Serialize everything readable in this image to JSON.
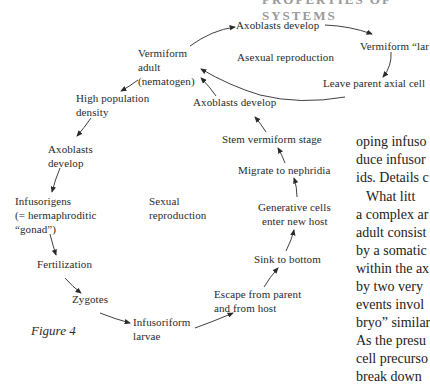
{
  "header_cut": "PROPERTIES OF SYSTEMS",
  "diagram": {
    "nodes": {
      "axoblasts_top": "Axoblasts develop",
      "vermiform_larva": "Vermiform “lar",
      "asexual": "Asexual reproduction",
      "leave_parent": "Leave parent axial cell",
      "vermiform_adult": [
        "Vermiform",
        "adult",
        "(nematogen)"
      ],
      "high_pop": [
        "High population",
        "density"
      ],
      "axoblasts_right": "Axoblasts develop",
      "stem_vermiform": "Stem vermiform stage",
      "migrate": "Migrate to nephridia",
      "generative": [
        "Generative cells",
        "enter new host"
      ],
      "sink": "Sink to bottom",
      "escape": [
        "Escape from parent",
        "and from host"
      ],
      "axoblasts_left": [
        "Axoblasts",
        "develop"
      ],
      "infusorigens": [
        "Infusorigens",
        "(= hermaphroditic",
        "“gonad”)"
      ],
      "sexual": [
        "Sexual",
        "reproduction"
      ],
      "fertilization": "Fertilization",
      "zygotes": "Zygotes",
      "infusoriform": [
        "Infusoriform",
        "larvae"
      ]
    },
    "caption": "Figure 4"
  },
  "body_text": [
    "oping infuso",
    "duce infusor",
    "ids. Details c",
    "    What litt",
    "a complex ar",
    "adult consist",
    "by a somatic",
    "within the ax",
    "by two very",
    "events invol",
    "bryo” similar",
    "As the presu",
    "cell precurso",
    "break down"
  ]
}
